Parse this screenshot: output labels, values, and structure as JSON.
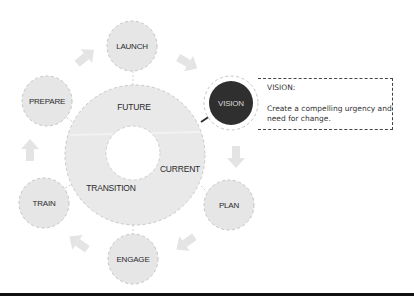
{
  "colors": {
    "node_fill": "#e6e6e6",
    "ring_fill": "#e9e9e9",
    "dash_stroke": "#c4c4c4",
    "arrow_fill": "#e2e2e2",
    "vision_fill": "#2f2f2f",
    "vision_text": "#d8d8d8",
    "callout_border": "#444444",
    "rule": "#111111"
  },
  "ring": {
    "labels": {
      "future": "FUTURE",
      "current": "CURRENT",
      "transition": "TRANSITION"
    }
  },
  "nodes": [
    {
      "id": "launch",
      "label": "LAUNCH",
      "cx": 132,
      "cy": 46
    },
    {
      "id": "vision",
      "label": "VISION",
      "cx": 231,
      "cy": 103,
      "highlighted": true
    },
    {
      "id": "plan",
      "label": "PLAN",
      "cx": 229,
      "cy": 205
    },
    {
      "id": "engage",
      "label": "ENGAGE",
      "cx": 133,
      "cy": 259
    },
    {
      "id": "train",
      "label": "TRAIN",
      "cx": 44,
      "cy": 203
    },
    {
      "id": "prepare",
      "label": "PREPARE",
      "cx": 47,
      "cy": 101
    }
  ],
  "callout": {
    "title": "VISION:",
    "body": "Create a compelling urgency and need for change."
  }
}
